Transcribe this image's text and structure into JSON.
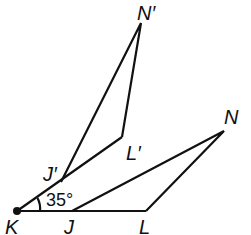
{
  "diagram": {
    "type": "geometry-rotation",
    "center": "K",
    "points": {
      "K": {
        "label": "K",
        "x": 17,
        "y": 211
      },
      "J": {
        "label": "J",
        "x": 72,
        "y": 211
      },
      "L": {
        "label": "L",
        "x": 146,
        "y": 211
      },
      "N": {
        "label": "N",
        "x": 224,
        "y": 131
      },
      "Jp": {
        "label": "J′",
        "x": 61,
        "y": 182
      },
      "Lp": {
        "label": "L′",
        "x": 122,
        "y": 137
      },
      "Np": {
        "label": "N′",
        "x": 141,
        "y": 23
      }
    },
    "figures": [
      {
        "name": "JLN",
        "vertices": [
          "J",
          "L",
          "N"
        ]
      },
      {
        "name": "J′L′N′",
        "vertices": [
          "J′",
          "L′",
          "N′"
        ]
      }
    ],
    "angle_label": "35°",
    "labels": {
      "K": "K",
      "J": "J",
      "L": "L",
      "N": "N",
      "Jp": "J′",
      "Lp": "L′",
      "Np": "N′"
    }
  }
}
